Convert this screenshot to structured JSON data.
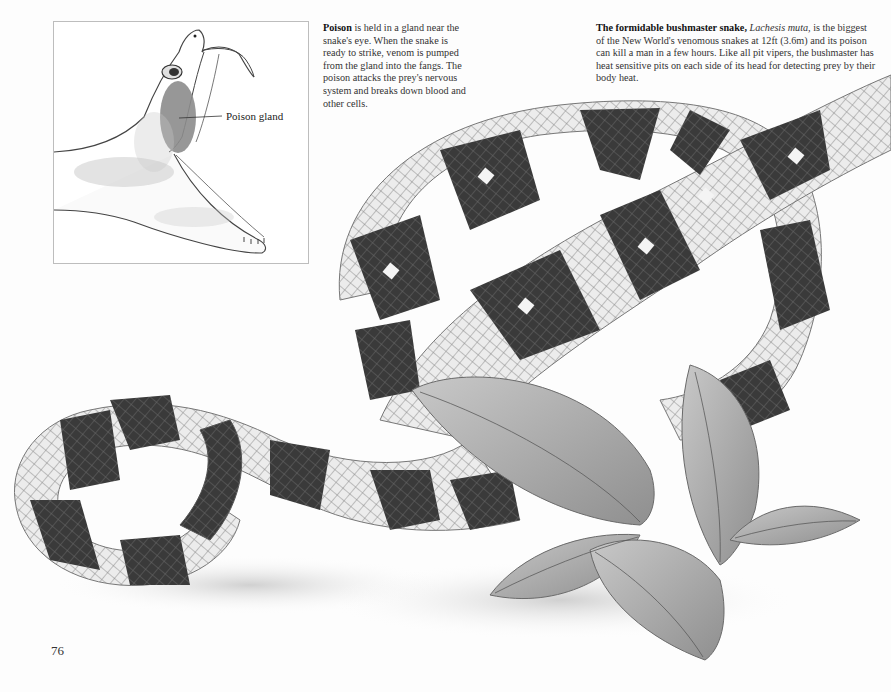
{
  "page": {
    "number": "76"
  },
  "inset_diagram": {
    "subject": "snake-head-open-mouth",
    "label": "Poison gland"
  },
  "captions": {
    "poison": {
      "lead": "Poison",
      "body": " is held in a gland near the snake's eye. When the snake is ready to strike, venom is pumped from the gland into the fangs. The poison attacks the prey's nervous system and breaks down blood and other cells."
    },
    "bushmaster": {
      "lead": "The formidable bushmaster snake,",
      "species": "Lachesis muta,",
      "body": " is the biggest of the New World's venomous snakes at 12ft (3.6m) and its poison can kill a man in a few hours. Like all pit vipers, the bushmaster has heat sensitive pits on each side of its head for detecting prey by their body heat."
    }
  },
  "illustration": {
    "subject": "bushmaster-snake-coiled-with-leaves",
    "colors": {
      "dark_band": "#3a3a3a",
      "light_band": "#e6e6e6",
      "scale_line": "#8a8a8a",
      "leaf": "#a8a8a8",
      "gland": "#8c8c8c"
    }
  }
}
